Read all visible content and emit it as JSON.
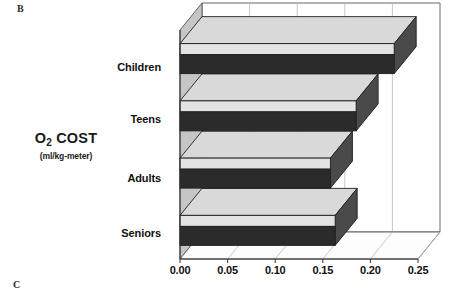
{
  "figure": {
    "panel_label_top": "B",
    "panel_label_bottom": "C"
  },
  "axis_title": {
    "main_prefix": "O",
    "main_subscript": "2",
    "main_suffix": " COST",
    "units": "(ml/kg-meter)"
  },
  "chart_data": {
    "type": "bar",
    "orientation": "horizontal",
    "title": "",
    "xlabel": "",
    "ylabel": "O2 COST (ml/kg-meter)",
    "categories": [
      "Children",
      "Teens",
      "Adults",
      "Seniors"
    ],
    "values": [
      0.225,
      0.185,
      0.158,
      0.163
    ],
    "xlim": [
      0.0,
      0.25
    ],
    "xticks": [
      0.0,
      0.05,
      0.1,
      0.15,
      0.2,
      0.25
    ],
    "xticklabels": [
      "0.00",
      "0.05",
      "0.10",
      "0.15",
      "0.20",
      "0.25"
    ],
    "grid": true,
    "grid_axis": "x",
    "legend": false,
    "style": "3d-bar",
    "colors": {
      "bar_front": "#2b2b2b",
      "bar_top": "#d9d9d9",
      "bar_side": "#4a4a4a",
      "wall": "#ffffff",
      "grid_line": "#b9b9b9",
      "axis_line": "#555555",
      "floor": "#fdfdfd",
      "left_wall": "#c6c6c6"
    }
  }
}
